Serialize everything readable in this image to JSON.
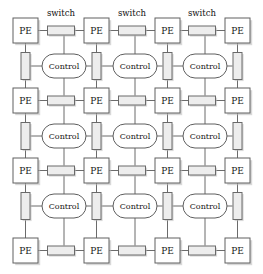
{
  "figure": {
    "kind": "mesh-architecture-diagram",
    "width": 263,
    "height": 274,
    "background_color": "#ffffff"
  },
  "labels": {
    "pe": "PE",
    "control": "Control",
    "switch_caption": "switch"
  },
  "colors": {
    "node_fill": "#ffffff",
    "node_stroke": "#606060",
    "switch_fill": "#ededed",
    "switch_stroke": "#6a6a6a",
    "wire": "#5a5a5a",
    "shadow": "#b8b8b8",
    "text": "#151515"
  },
  "geometry": {
    "pe_size": 25,
    "pe_cols_x": [
      13,
      84,
      155,
      225
    ],
    "pe_rows_y": [
      18,
      88,
      158,
      238
    ],
    "control_width": 44,
    "control_height": 24,
    "control_cols_cx": [
      64,
      135,
      205
    ],
    "control_rows_cy": [
      66,
      136,
      206
    ],
    "switch_h_width": 27,
    "switch_h_height": 9,
    "switch_v_width": 9,
    "switch_v_height": 27
  },
  "pe_nodes": [
    {
      "id": "pe-r0-c0",
      "row": 0,
      "col": 0,
      "x": 13,
      "y": 18,
      "label": "PE"
    },
    {
      "id": "pe-r0-c1",
      "row": 0,
      "col": 1,
      "x": 84,
      "y": 18,
      "label": "PE"
    },
    {
      "id": "pe-r0-c2",
      "row": 0,
      "col": 2,
      "x": 155,
      "y": 18,
      "label": "PE"
    },
    {
      "id": "pe-r0-c3",
      "row": 0,
      "col": 3,
      "x": 225,
      "y": 18,
      "label": "PE"
    },
    {
      "id": "pe-r1-c0",
      "row": 1,
      "col": 0,
      "x": 13,
      "y": 88,
      "label": "PE"
    },
    {
      "id": "pe-r1-c1",
      "row": 1,
      "col": 1,
      "x": 84,
      "y": 88,
      "label": "PE"
    },
    {
      "id": "pe-r1-c2",
      "row": 1,
      "col": 2,
      "x": 155,
      "y": 88,
      "label": "PE"
    },
    {
      "id": "pe-r1-c3",
      "row": 1,
      "col": 3,
      "x": 225,
      "y": 88,
      "label": "PE"
    },
    {
      "id": "pe-r2-c0",
      "row": 2,
      "col": 0,
      "x": 13,
      "y": 158,
      "label": "PE"
    },
    {
      "id": "pe-r2-c1",
      "row": 2,
      "col": 1,
      "x": 84,
      "y": 158,
      "label": "PE"
    },
    {
      "id": "pe-r2-c2",
      "row": 2,
      "col": 2,
      "x": 155,
      "y": 158,
      "label": "PE"
    },
    {
      "id": "pe-r2-c3",
      "row": 2,
      "col": 3,
      "x": 225,
      "y": 158,
      "label": "PE"
    },
    {
      "id": "pe-r3-c0",
      "row": 3,
      "col": 0,
      "x": 13,
      "y": 238,
      "label": "PE"
    },
    {
      "id": "pe-r3-c1",
      "row": 3,
      "col": 1,
      "x": 84,
      "y": 238,
      "label": "PE"
    },
    {
      "id": "pe-r3-c2",
      "row": 3,
      "col": 2,
      "x": 155,
      "y": 238,
      "label": "PE"
    },
    {
      "id": "pe-r3-c3",
      "row": 3,
      "col": 3,
      "x": 225,
      "y": 238,
      "label": "PE"
    }
  ],
  "control_nodes": [
    {
      "id": "control-r0-c0",
      "row": 0,
      "col": 0,
      "cx": 64,
      "cy": 66,
      "label": "Control"
    },
    {
      "id": "control-r0-c1",
      "row": 0,
      "col": 1,
      "cx": 135,
      "cy": 66,
      "label": "Control"
    },
    {
      "id": "control-r0-c2",
      "row": 0,
      "col": 2,
      "cx": 205,
      "cy": 66,
      "label": "Control"
    },
    {
      "id": "control-r1-c0",
      "row": 1,
      "col": 0,
      "cx": 64,
      "cy": 136,
      "label": "Control"
    },
    {
      "id": "control-r1-c1",
      "row": 1,
      "col": 1,
      "cx": 135,
      "cy": 136,
      "label": "Control"
    },
    {
      "id": "control-r1-c2",
      "row": 1,
      "col": 2,
      "cx": 205,
      "cy": 136,
      "label": "Control"
    },
    {
      "id": "control-r2-c0",
      "row": 2,
      "col": 0,
      "cx": 64,
      "cy": 206,
      "label": "Control"
    },
    {
      "id": "control-r2-c1",
      "row": 2,
      "col": 1,
      "cx": 135,
      "cy": 206,
      "label": "Control"
    },
    {
      "id": "control-r2-c2",
      "row": 2,
      "col": 2,
      "cx": 205,
      "cy": 206,
      "label": "Control"
    }
  ],
  "switches_horizontal": [
    {
      "id": "switch-h-r0-c0",
      "row": 0,
      "col": 0,
      "cx": 61,
      "cy": 30.5
    },
    {
      "id": "switch-h-r0-c1",
      "row": 0,
      "col": 1,
      "cx": 132,
      "cy": 30.5
    },
    {
      "id": "switch-h-r0-c2",
      "row": 0,
      "col": 2,
      "cx": 202,
      "cy": 30.5
    },
    {
      "id": "switch-h-r1-c0",
      "row": 1,
      "col": 0,
      "cx": 61,
      "cy": 100.5
    },
    {
      "id": "switch-h-r1-c1",
      "row": 1,
      "col": 1,
      "cx": 132,
      "cy": 100.5
    },
    {
      "id": "switch-h-r1-c2",
      "row": 1,
      "col": 2,
      "cx": 202,
      "cy": 100.5
    },
    {
      "id": "switch-h-r2-c0",
      "row": 2,
      "col": 0,
      "cx": 61,
      "cy": 170.5
    },
    {
      "id": "switch-h-r2-c1",
      "row": 2,
      "col": 1,
      "cx": 132,
      "cy": 170.5
    },
    {
      "id": "switch-h-r2-c2",
      "row": 2,
      "col": 2,
      "cx": 202,
      "cy": 170.5
    },
    {
      "id": "switch-h-r3-c0",
      "row": 3,
      "col": 0,
      "cx": 61,
      "cy": 250.5
    },
    {
      "id": "switch-h-r3-c1",
      "row": 3,
      "col": 1,
      "cx": 132,
      "cy": 250.5
    },
    {
      "id": "switch-h-r3-c2",
      "row": 3,
      "col": 2,
      "cx": 202,
      "cy": 250.5
    }
  ],
  "switches_vertical": [
    {
      "id": "switch-v-r0-c0",
      "row": 0,
      "col": 0,
      "cx": 25.5,
      "cy": 66
    },
    {
      "id": "switch-v-r0-c1",
      "row": 0,
      "col": 1,
      "cx": 96.5,
      "cy": 66
    },
    {
      "id": "switch-v-r0-c2",
      "row": 0,
      "col": 2,
      "cx": 167.5,
      "cy": 66
    },
    {
      "id": "switch-v-r0-c3",
      "row": 0,
      "col": 3,
      "cx": 237.5,
      "cy": 66
    },
    {
      "id": "switch-v-r1-c0",
      "row": 1,
      "col": 0,
      "cx": 25.5,
      "cy": 136
    },
    {
      "id": "switch-v-r1-c1",
      "row": 1,
      "col": 1,
      "cx": 96.5,
      "cy": 136
    },
    {
      "id": "switch-v-r1-c2",
      "row": 1,
      "col": 2,
      "cx": 167.5,
      "cy": 136
    },
    {
      "id": "switch-v-r1-c3",
      "row": 1,
      "col": 3,
      "cx": 237.5,
      "cy": 136
    },
    {
      "id": "switch-v-r2-c0",
      "row": 2,
      "col": 0,
      "cx": 25.5,
      "cy": 206
    },
    {
      "id": "switch-v-r2-c1",
      "row": 2,
      "col": 1,
      "cx": 96.5,
      "cy": 206
    },
    {
      "id": "switch-v-r2-c2",
      "row": 2,
      "col": 2,
      "cx": 167.5,
      "cy": 206
    },
    {
      "id": "switch-v-r2-c3",
      "row": 2,
      "col": 3,
      "cx": 237.5,
      "cy": 206
    }
  ],
  "switch_captions": [
    {
      "id": "switch-caption-0",
      "text": "switch",
      "x": 61,
      "y": 16
    },
    {
      "id": "switch-caption-1",
      "text": "switch",
      "x": 132,
      "y": 16
    },
    {
      "id": "switch-caption-2",
      "text": "switch",
      "x": 202,
      "y": 16
    }
  ]
}
